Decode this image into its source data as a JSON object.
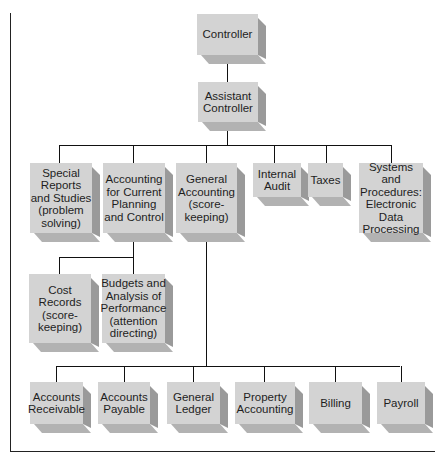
{
  "diagram": {
    "type": "org-chart",
    "colors": {
      "box_face": "#d3d3d3",
      "box_side": "#9a9a9a",
      "box_bottom": "#b2b2b2",
      "line": "#111111"
    },
    "nodes": {
      "controller": "Controller",
      "assistant_controller": "Assistant\nController",
      "special_reports": "Special\nReports\nand Studies\n(problem\nsolving)",
      "current_planning": "Accounting\nfor Current\nPlanning\nand Control",
      "general_accounting": "General\nAccounting\n(score-\nkeeping)",
      "internal_audit": "Internal\nAudit",
      "taxes": "Taxes",
      "systems": "Systems and\nProcedures:\nElectronic\nData\nProcessing",
      "cost_records": "Cost\nRecords\n(score-\nkeeping)",
      "budgets": "Budgets and\nAnalysis of\nPerformance\n(attention\ndirecting)",
      "accounts_receivable": "Accounts\nReceivable",
      "accounts_payable": "Accounts\nPayable",
      "general_ledger": "General\nLedger",
      "property_accounting": "Property\nAccounting",
      "billing": "Billing",
      "payroll": "Payroll"
    },
    "edges": [
      [
        "controller",
        "assistant_controller"
      ],
      [
        "assistant_controller",
        "special_reports"
      ],
      [
        "assistant_controller",
        "current_planning"
      ],
      [
        "assistant_controller",
        "general_accounting"
      ],
      [
        "assistant_controller",
        "internal_audit"
      ],
      [
        "assistant_controller",
        "taxes"
      ],
      [
        "assistant_controller",
        "systems"
      ],
      [
        "current_planning",
        "cost_records"
      ],
      [
        "current_planning",
        "budgets"
      ],
      [
        "general_accounting",
        "accounts_receivable"
      ],
      [
        "general_accounting",
        "accounts_payable"
      ],
      [
        "general_accounting",
        "general_ledger"
      ],
      [
        "general_accounting",
        "property_accounting"
      ],
      [
        "general_accounting",
        "billing"
      ],
      [
        "general_accounting",
        "payroll"
      ]
    ]
  }
}
